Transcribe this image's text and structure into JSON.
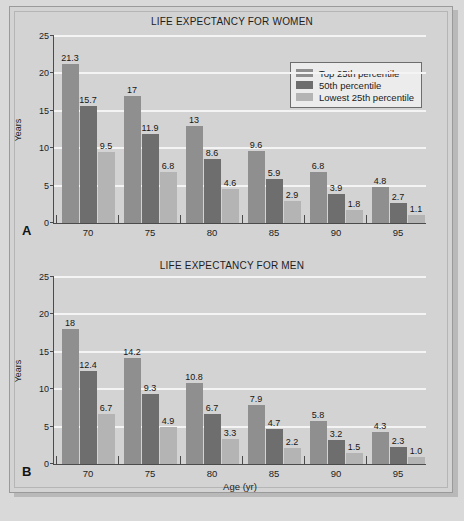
{
  "figure": {
    "background_color": "#d3d3d3",
    "axis_color": "#4b4b4b",
    "gridline_color": "#f4f4f4"
  },
  "legend": {
    "position": "top-right-panel-a",
    "entries": [
      {
        "label": "Top 25th percentile",
        "color": "#8f8f8f"
      },
      {
        "label": "50th percentile",
        "color": "#6e6e6e"
      },
      {
        "label": "Lowest 25th percentile",
        "color": "#b4b4b4"
      }
    ]
  },
  "panels": [
    {
      "letter": "A",
      "title": "LIFE EXPECTANCY FOR WOMEN"
    },
    {
      "letter": "B",
      "title": "LIFE EXPECTANCY FOR MEN"
    }
  ],
  "chart_data": [
    {
      "type": "bar",
      "panel": "A",
      "title": "LIFE EXPECTANCY FOR WOMEN",
      "xlabel": "",
      "ylabel": "Years",
      "categories": [
        "70",
        "75",
        "80",
        "85",
        "90",
        "95"
      ],
      "ytick_labels": [
        "0",
        "5",
        "10",
        "15",
        "20",
        "25"
      ],
      "yticks": [
        0,
        5,
        10,
        15,
        20,
        25
      ],
      "ylim": [
        0,
        25
      ],
      "grid": true,
      "legend_position": "upper right",
      "series": [
        {
          "name": "Top 25th percentile",
          "color": "#8f8f8f",
          "values": [
            21.3,
            17,
            13,
            9.6,
            6.8,
            4.8
          ],
          "labels": [
            "21.3",
            "17",
            "13",
            "9.6",
            "6.8",
            "4.8"
          ]
        },
        {
          "name": "50th percentile",
          "color": "#6e6e6e",
          "values": [
            15.7,
            11.9,
            8.6,
            5.9,
            3.9,
            2.7
          ],
          "labels": [
            "15.7",
            "11.9",
            "8.6",
            "5.9",
            "3.9",
            "2.7"
          ]
        },
        {
          "name": "Lowest 25th percentile",
          "color": "#b4b4b4",
          "values": [
            9.5,
            6.8,
            4.6,
            2.9,
            1.8,
            1.1
          ],
          "labels": [
            "9.5",
            "6.8",
            "4.6",
            "2.9",
            "1.8",
            "1.1"
          ]
        }
      ]
    },
    {
      "type": "bar",
      "panel": "B",
      "title": "LIFE EXPECTANCY FOR MEN",
      "xlabel": "Age (yr)",
      "ylabel": "Years",
      "categories": [
        "70",
        "75",
        "80",
        "85",
        "90",
        "95"
      ],
      "ytick_labels": [
        "0",
        "5",
        "10",
        "15",
        "20",
        "25"
      ],
      "yticks": [
        0,
        5,
        10,
        15,
        20,
        25
      ],
      "ylim": [
        0,
        25
      ],
      "grid": true,
      "legend_position": "none",
      "series": [
        {
          "name": "Top 25th percentile",
          "color": "#8f8f8f",
          "values": [
            18,
            14.2,
            10.8,
            7.9,
            5.8,
            4.3
          ],
          "labels": [
            "18",
            "14.2",
            "10.8",
            "7.9",
            "5.8",
            "4.3"
          ]
        },
        {
          "name": "50th percentile",
          "color": "#6e6e6e",
          "values": [
            12.4,
            9.3,
            6.7,
            4.7,
            3.2,
            2.3
          ],
          "labels": [
            "12.4",
            "9.3",
            "6.7",
            "4.7",
            "3.2",
            "2.3"
          ]
        },
        {
          "name": "Lowest 25th percentile",
          "color": "#b4b4b4",
          "values": [
            6.7,
            4.9,
            3.3,
            2.2,
            1.5,
            1.0
          ],
          "labels": [
            "6.7",
            "4.9",
            "3.3",
            "2.2",
            "1.5",
            "1.0"
          ]
        }
      ]
    }
  ]
}
